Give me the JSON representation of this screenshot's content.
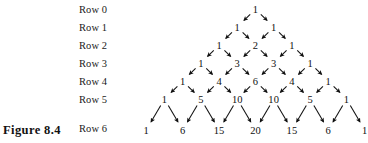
{
  "figure": {
    "caption": "Figure 8.4",
    "caption_x": 3,
    "caption_y": 123
  },
  "colors": {
    "background": "#ffffff",
    "text": "#101010",
    "arrow": "#111111"
  },
  "row_labels": {
    "x": 79,
    "items": [
      {
        "label": "Row 0",
        "y": 4
      },
      {
        "label": "Row 1",
        "y": 22
      },
      {
        "label": "Row 2",
        "y": 40
      },
      {
        "label": "Row 3",
        "y": 58
      },
      {
        "label": "Row 4",
        "y": 76
      },
      {
        "label": "Row 5",
        "y": 94
      },
      {
        "label": "Row 6",
        "y": 123
      }
    ]
  },
  "chart_data": {
    "type": "diagram",
    "title": "Figure 8.4",
    "center_x": 255.5,
    "x_spacing": 36.4,
    "rows": [
      {
        "row": 0,
        "y": 9,
        "values": [
          1
        ]
      },
      {
        "row": 1,
        "y": 27,
        "values": [
          1,
          1
        ]
      },
      {
        "row": 2,
        "y": 45,
        "values": [
          1,
          2,
          1
        ]
      },
      {
        "row": 3,
        "y": 63,
        "values": [
          1,
          3,
          3,
          1
        ]
      },
      {
        "row": 4,
        "y": 81,
        "values": [
          1,
          4,
          6,
          4,
          1
        ]
      },
      {
        "row": 5,
        "y": 99,
        "values": [
          1,
          5,
          10,
          10,
          5,
          1
        ]
      },
      {
        "row": 6,
        "y": 130,
        "values": [
          1,
          6,
          15,
          20,
          15,
          6,
          1
        ]
      }
    ],
    "arrow_rule": "each interior entry receives two arrows, one from the entry up-left and one from the entry up-right"
  }
}
